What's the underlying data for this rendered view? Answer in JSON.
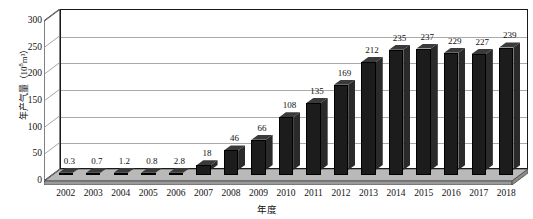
{
  "chart_data": {
    "type": "bar",
    "title": "",
    "subtitle": "",
    "xlabel": "年度",
    "ylabel": "年产气量（10⁸m³）",
    "ylabel_parts": {
      "prefix": "年产气量（10",
      "sup": "8",
      "suffix": "m³）"
    },
    "categories": [
      "2002",
      "2003",
      "2004",
      "2005",
      "2006",
      "2007",
      "2008",
      "2009",
      "2010",
      "2011",
      "2012",
      "2013",
      "2014",
      "2015",
      "2016",
      "2017",
      "2018"
    ],
    "values": [
      0.3,
      0.7,
      1.2,
      0.8,
      2.8,
      18,
      46,
      66,
      108,
      135,
      169,
      212,
      235,
      237,
      229,
      227,
      239
    ],
    "value_labels": [
      "0.3",
      "0.7",
      "1.2",
      "0.8",
      "2.8",
      "18",
      "46",
      "66",
      "108",
      "135",
      "169",
      "212",
      "235",
      "237",
      "229",
      "227",
      "239"
    ],
    "ylim": [
      0,
      300
    ],
    "yticks": [
      0,
      50,
      100,
      150,
      200,
      250,
      300
    ],
    "ytick_labels": [
      "0",
      "50",
      "100",
      "150",
      "200",
      "250",
      "300"
    ],
    "grid": true,
    "grid_axis": "y",
    "legend": false,
    "legend_position": "none",
    "style": "3d-column",
    "colors": {
      "bar_front": "#1c1c1c",
      "bar_top": "#3a3a3a",
      "bar_side": "#2a2a2a",
      "gridline": "#aaaaaa",
      "axis": "#1a1a1a",
      "floor": "#b8b8b8",
      "background": "#ffffff",
      "text": "#111111"
    }
  }
}
